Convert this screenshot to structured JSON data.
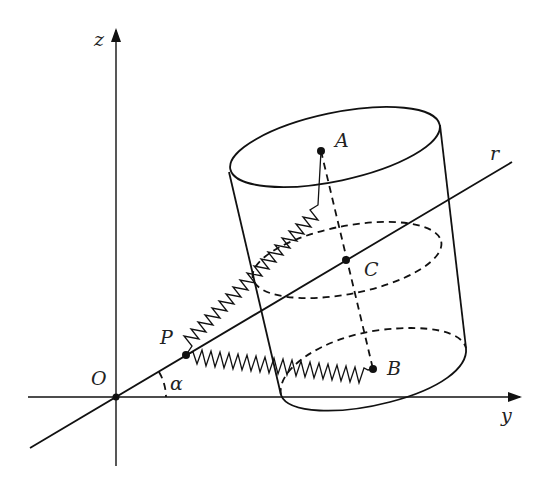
{
  "diagram": {
    "type": "3D mechanics diagram: tilted cylinder with springs",
    "axes": {
      "z_label": "z",
      "y_label": "y",
      "origin_label": "O"
    },
    "line": {
      "label": "r",
      "angle_label": "α"
    },
    "points": {
      "P": "P",
      "A": "A",
      "B": "B",
      "C": "C"
    },
    "elements": [
      "z axis (vertical, arrow up)",
      "y axis (horizontal, arrow right)",
      "line r through O at angle α to y axis",
      "tilted cylinder with axis along dashed segment A–B through C",
      "dashed middle cross-section ellipse through C",
      "spring from P to A",
      "spring from P to B"
    ]
  }
}
